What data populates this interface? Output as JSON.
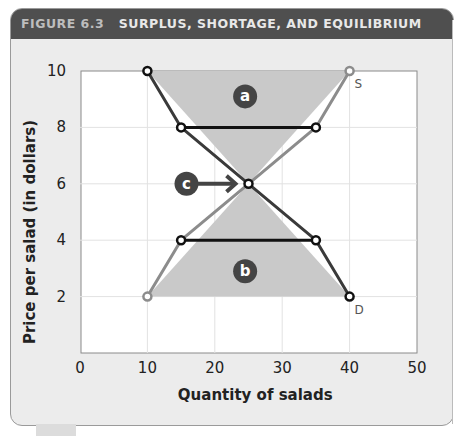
{
  "figure": {
    "label": "FIGURE 6.3",
    "title": "SURPLUS, SHORTAGE, AND EQUILIBRIUM"
  },
  "chart_data": {
    "type": "line",
    "title": "Surplus, Shortage, and Equilibrium",
    "xlabel": "Quantity of salads",
    "ylabel": "Price per salad (in dollars)",
    "xlim": [
      0,
      50
    ],
    "ylim": [
      0,
      10
    ],
    "xticks": [
      0,
      10,
      20,
      30,
      40,
      50
    ],
    "yticks": [
      2,
      4,
      6,
      8,
      10
    ],
    "grid": true,
    "series": [
      {
        "name": "D",
        "label": "D",
        "color": "#3a3a3a",
        "points": [
          [
            10,
            10
          ],
          [
            15,
            8
          ],
          [
            25,
            6
          ],
          [
            35,
            4
          ],
          [
            40,
            2
          ]
        ]
      },
      {
        "name": "S",
        "label": "S",
        "color": "#8c8c8c",
        "points": [
          [
            10,
            2
          ],
          [
            15,
            4
          ],
          [
            25,
            6
          ],
          [
            35,
            8
          ],
          [
            40,
            10
          ]
        ]
      }
    ],
    "horizontal_segments": [
      {
        "name": "surplus-line",
        "price": 8,
        "from": 15,
        "to": 35
      },
      {
        "name": "shortage-line",
        "price": 4,
        "from": 15,
        "to": 35
      }
    ],
    "shaded_regions": [
      {
        "name": "region-a",
        "label": "a",
        "meaning": "surplus",
        "polygon": [
          [
            10,
            10
          ],
          [
            40,
            10
          ],
          [
            25,
            6
          ]
        ],
        "badge_at": [
          24.5,
          9.1
        ]
      },
      {
        "name": "region-b",
        "label": "b",
        "meaning": "shortage",
        "polygon": [
          [
            10,
            2
          ],
          [
            40,
            2
          ],
          [
            25,
            6
          ]
        ],
        "badge_at": [
          24.5,
          2.9
        ]
      }
    ],
    "annotations": [
      {
        "name": "equilibrium-callout",
        "label": "c",
        "target": [
          25,
          6
        ]
      }
    ]
  }
}
